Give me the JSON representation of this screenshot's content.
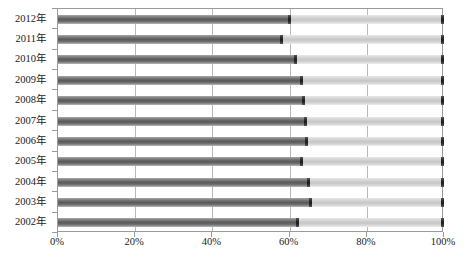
{
  "chart_data": {
    "type": "bar",
    "subtype": "stacked-horizontal-100-percent",
    "title": "",
    "subtitle": "",
    "xlabel": "",
    "ylabel": "",
    "orientation": "horizontal",
    "stacked": true,
    "normalized": true,
    "grid": true,
    "legend": "none",
    "xlim": [
      0,
      100
    ],
    "xticks": [
      0,
      20,
      40,
      60,
      80,
      100
    ],
    "xticklabels": [
      "0%",
      "20%",
      "40%",
      "60%",
      "80%",
      "100%"
    ],
    "categories": [
      "2012年",
      "2011年",
      "2010年",
      "2009年",
      "2008年",
      "2007年",
      "2006年",
      "2005年",
      "2004年",
      "2003年",
      "2002年"
    ],
    "series": [
      {
        "name": "series-1",
        "color": "#5e5e5e",
        "values": [
          60.0,
          58.0,
          61.5,
          63.0,
          63.5,
          64.0,
          64.5,
          63.0,
          65.0,
          65.5,
          62.0
        ]
      },
      {
        "name": "series-2",
        "color": "#cfcfcf",
        "values": [
          40.0,
          42.0,
          38.5,
          37.0,
          36.5,
          36.0,
          35.5,
          37.0,
          35.0,
          34.5,
          38.0
        ]
      }
    ]
  },
  "axes": {
    "x_tick_labels": [
      "0%",
      "20%",
      "40%",
      "60%",
      "80%",
      "100%"
    ],
    "y_tick_labels": [
      "2012年",
      "2011年",
      "2010年",
      "2009年",
      "2008年",
      "2007年",
      "2006年",
      "2005年",
      "2004年",
      "2003年",
      "2002年"
    ]
  },
  "colors": {
    "series_1": "#5e5e5e",
    "series_2": "#cfcfcf",
    "cap": "#1b1b1b",
    "gridline": "#b8b8b8",
    "frame": "#9a9a9a",
    "text": "#1a1a1a",
    "background": "#ffffff"
  }
}
